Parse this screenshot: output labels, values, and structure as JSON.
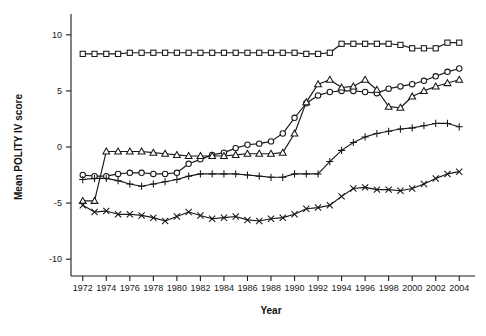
{
  "chart_data": {
    "type": "line",
    "title": "",
    "xlabel": "Year",
    "ylabel": "Mean POLITY IV score",
    "xlim": [
      1971,
      2005
    ],
    "ylim": [
      -11.5,
      11.5
    ],
    "grid": false,
    "legend_position": "none",
    "x_tick_labels": [
      "1972",
      "1974",
      "1976",
      "1978",
      "1980",
      "1982",
      "1984",
      "1986",
      "1988",
      "1990",
      "1992",
      "1994",
      "1996",
      "1998",
      "2000",
      "2002",
      "2004"
    ],
    "y_tick_labels": [
      "10",
      "5",
      "0",
      "-5",
      "-10"
    ],
    "y_ticks": [
      10,
      5,
      0,
      -5,
      -10
    ],
    "x": [
      1972,
      1973,
      1974,
      1975,
      1976,
      1977,
      1978,
      1979,
      1980,
      1981,
      1982,
      1983,
      1984,
      1985,
      1986,
      1987,
      1988,
      1989,
      1990,
      1991,
      1992,
      1993,
      1994,
      1995,
      1996,
      1997,
      1998,
      1999,
      2000,
      2001,
      2002,
      2003,
      2004
    ],
    "series": [
      {
        "name": "squares",
        "marker": "square",
        "values": [
          8.3,
          8.3,
          8.3,
          8.3,
          8.4,
          8.4,
          8.4,
          8.4,
          8.4,
          8.4,
          8.4,
          8.4,
          8.4,
          8.4,
          8.4,
          8.4,
          8.4,
          8.4,
          8.4,
          8.3,
          8.3,
          8.4,
          9.2,
          9.2,
          9.2,
          9.2,
          9.2,
          9.1,
          8.8,
          8.8,
          8.8,
          9.3,
          9.3
        ]
      },
      {
        "name": "circles",
        "marker": "circle",
        "values": [
          -2.5,
          -2.6,
          -2.6,
          -2.4,
          -2.3,
          -2.3,
          -2.4,
          -2.4,
          -2.3,
          -1.5,
          -1.1,
          -0.7,
          -0.5,
          -0.1,
          0.2,
          0.3,
          0.5,
          1.2,
          2.6,
          3.9,
          4.6,
          4.9,
          5.0,
          5.0,
          4.9,
          4.8,
          5.2,
          5.4,
          5.6,
          5.9,
          6.3,
          6.7,
          7.0
        ]
      },
      {
        "name": "triangles",
        "marker": "triangle",
        "values": [
          -4.8,
          -4.8,
          -0.4,
          -0.4,
          -0.4,
          -0.4,
          -0.5,
          -0.6,
          -0.7,
          -0.8,
          -0.8,
          -0.8,
          -0.8,
          -0.7,
          -0.6,
          -0.6,
          -0.6,
          -0.5,
          1.2,
          4.0,
          5.6,
          6.0,
          5.3,
          5.4,
          6.0,
          5.1,
          3.6,
          3.5,
          4.5,
          5.0,
          5.4,
          5.7,
          6.0
        ]
      },
      {
        "name": "plus",
        "marker": "plus",
        "values": [
          -2.9,
          -2.8,
          -2.8,
          -3.0,
          -3.3,
          -3.5,
          -3.3,
          -3.1,
          -2.9,
          -2.6,
          -2.4,
          -2.4,
          -2.4,
          -2.4,
          -2.5,
          -2.6,
          -2.7,
          -2.7,
          -2.4,
          -2.4,
          -2.4,
          -1.3,
          -0.3,
          0.4,
          0.9,
          1.2,
          1.4,
          1.6,
          1.7,
          1.9,
          2.1,
          2.1,
          1.8
        ]
      },
      {
        "name": "crosses",
        "marker": "cross",
        "values": [
          -5.2,
          -5.8,
          -5.7,
          -6.0,
          -6.0,
          -6.1,
          -6.3,
          -6.6,
          -6.2,
          -5.8,
          -6.1,
          -6.4,
          -6.3,
          -6.2,
          -6.5,
          -6.6,
          -6.4,
          -6.3,
          -6.0,
          -5.5,
          -5.4,
          -5.2,
          -4.4,
          -3.7,
          -3.6,
          -3.8,
          -3.8,
          -3.9,
          -3.7,
          -3.3,
          -2.8,
          -2.4,
          -2.2
        ]
      }
    ]
  }
}
